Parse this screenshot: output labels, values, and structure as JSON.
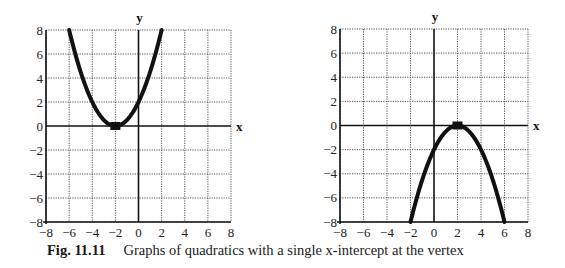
{
  "caption": {
    "label": "Fig. 11.11",
    "text": "Graphs of quadratics with a single x-intercept at the vertex"
  },
  "chart_data": [
    {
      "type": "line",
      "title": "",
      "xlabel": "x",
      "ylabel": "y",
      "xlim": [
        -8,
        8
      ],
      "ylim": [
        -8,
        8
      ],
      "xticks": [
        -8,
        -6,
        -4,
        -2,
        0,
        2,
        4,
        6,
        8
      ],
      "yticks": [
        -8,
        -6,
        -4,
        -2,
        0,
        2,
        4,
        6,
        8
      ],
      "grid": true,
      "series": [
        {
          "name": "y = 0.5(x + 2)^2",
          "x": [
            -6,
            -5,
            -4,
            -3,
            -2,
            -1,
            0,
            1,
            2
          ],
          "y": [
            8,
            4.5,
            2,
            0.5,
            0,
            0.5,
            2,
            4.5,
            8
          ]
        }
      ],
      "annotations": [
        {
          "type": "point",
          "label": "vertex",
          "x": -2,
          "y": 0
        }
      ]
    },
    {
      "type": "line",
      "title": "",
      "xlabel": "x",
      "ylabel": "y",
      "xlim": [
        -8,
        8
      ],
      "ylim": [
        -8,
        8
      ],
      "xticks": [
        -8,
        -6,
        -4,
        -2,
        0,
        2,
        4,
        6,
        8
      ],
      "yticks": [
        -8,
        -6,
        -4,
        -2,
        0,
        2,
        4,
        6,
        8
      ],
      "grid": true,
      "series": [
        {
          "name": "y = -0.5(x - 2)^2",
          "x": [
            -2,
            -1,
            0,
            1,
            2,
            3,
            4,
            5,
            6
          ],
          "y": [
            -8,
            -4.5,
            -2,
            -0.5,
            0,
            -0.5,
            -2,
            -4.5,
            -8
          ]
        }
      ],
      "annotations": [
        {
          "type": "point",
          "label": "vertex",
          "x": 2,
          "y": 0
        }
      ]
    }
  ]
}
